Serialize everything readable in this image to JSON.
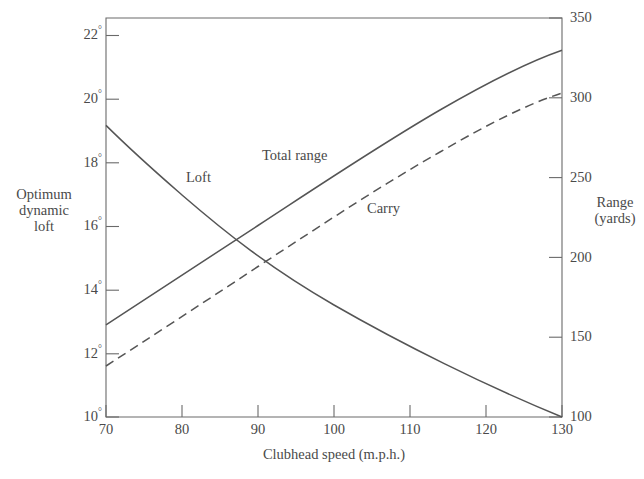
{
  "chart_data": {
    "type": "line",
    "title": "",
    "xlabel": "Clubhead speed (m.p.h.)",
    "ylabel": "Optimum dynamic loft",
    "ylabel_right": "Range (yards)",
    "xlim": [
      70,
      130
    ],
    "xticks": [
      70,
      80,
      90,
      100,
      110,
      120,
      130
    ],
    "xtick_labels": [
      "70",
      "80",
      "90",
      "100",
      "110",
      "120",
      "130"
    ],
    "ylim_left": [
      10,
      22
    ],
    "yticks_left": [
      10,
      12,
      14,
      16,
      18,
      20,
      22
    ],
    "ytick_labels_left": [
      "10°",
      "12°",
      "14°",
      "16°",
      "18°",
      "20°",
      "22°"
    ],
    "ylim_right": [
      100,
      350
    ],
    "yticks_right": [
      100,
      150,
      200,
      250,
      300,
      350
    ],
    "ytick_labels_right": [
      "100",
      "150",
      "200",
      "250",
      "300",
      "350"
    ],
    "grid": false,
    "legend": "inline-annotations",
    "series": [
      {
        "name": "Loft",
        "axis": "left",
        "style": "solid",
        "color": "#4a4a4a",
        "x": [
          70,
          75,
          80,
          85,
          90,
          95,
          100,
          105,
          110,
          115,
          120,
          125,
          130
        ],
        "values": [
          19.0,
          18.0,
          17.1,
          16.3,
          15.5,
          14.8,
          14.1,
          13.4,
          12.7,
          12.0,
          11.3,
          10.65,
          10.0
        ]
      },
      {
        "name": "Total range",
        "axis": "right",
        "style": "solid",
        "color": "#4a4a4a",
        "x": [
          70,
          75,
          80,
          85,
          90,
          95,
          100,
          105,
          110,
          115,
          120,
          125,
          130
        ],
        "values": [
          160,
          177,
          194,
          211,
          228,
          245,
          262,
          278,
          292,
          305,
          316,
          325,
          332
        ]
      },
      {
        "name": "Carry",
        "axis": "right",
        "style": "dashed",
        "color": "#4a4a4a",
        "x": [
          70,
          75,
          80,
          85,
          90,
          95,
          100,
          105,
          110,
          115,
          120,
          125,
          130
        ],
        "values": [
          134,
          150,
          167,
          184,
          201,
          218,
          235,
          252,
          268,
          282,
          294,
          302,
          308
        ]
      }
    ],
    "annotations": [
      {
        "text": "Loft",
        "x_px": 186,
        "y_px": 170
      },
      {
        "text": "Total range",
        "x_px": 262,
        "y_px": 148
      },
      {
        "text": "Carry",
        "x_px": 367,
        "y_px": 201
      }
    ]
  },
  "axes": {
    "x_title": "Clubhead speed (m.p.h.)",
    "y_left_title_lines": [
      "Optimum",
      "dynamic",
      "loft"
    ],
    "y_right_title_lines": [
      "Range",
      "(yards)"
    ]
  },
  "colors": {
    "ink": "#4a4a4a",
    "line": "#555555",
    "background": "#ffffff"
  }
}
